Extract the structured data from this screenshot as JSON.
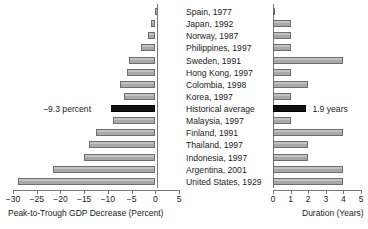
{
  "chart_data": {
    "type": "bar",
    "title": "",
    "subtitle": "",
    "orientation": "horizontal",
    "layout": "paired-diverging-panels",
    "grid": false,
    "legend": null,
    "categories": [
      "Spain, 1977",
      "Japan, 1992",
      "Norway, 1987",
      "Philippines, 1997",
      "Sweden, 1991",
      "Hong Kong, 1997",
      "Colombia, 1998",
      "Korea, 1997",
      "Historical average",
      "Malaysia, 1997",
      "Finland, 1991",
      "Thailand, 1997",
      "Indonesia, 1997",
      "Argentina, 2001",
      "United States, 1929"
    ],
    "panels": [
      {
        "name": "gdp-decrease",
        "xlabel": "Peak-to-Trough GDP Decrease (Percent)",
        "xlim": [
          -30,
          5
        ],
        "xticks": [
          -30,
          -25,
          -20,
          -15,
          -10,
          -5,
          0,
          5
        ],
        "xticklabels": [
          "−30",
          "−25",
          "−20",
          "−15",
          "−10",
          "−5",
          "0",
          "5"
        ],
        "values": [
          0.6,
          -1.0,
          -1.6,
          -3.0,
          -5.5,
          -6.0,
          -7.5,
          -6.7,
          -9.3,
          -9.0,
          -12.5,
          -14.0,
          -15.0,
          -21.5,
          -29.0
        ],
        "annotation": "−9.3 percent",
        "annotation_row": 8
      },
      {
        "name": "duration",
        "xlabel": "Duration (Years)",
        "xlim": [
          0,
          5
        ],
        "xticks": [
          0,
          1,
          2,
          3,
          4,
          5
        ],
        "xticklabels": [
          "0",
          "1",
          "2",
          "3",
          "4",
          "5"
        ],
        "values": [
          0.0,
          1.0,
          1.0,
          1.0,
          4.0,
          1.0,
          2.0,
          1.0,
          1.9,
          1.0,
          4.0,
          2.0,
          2.0,
          4.0,
          4.0
        ],
        "annotation": "1.9 years",
        "annotation_row": 8
      }
    ],
    "highlight_row": 8,
    "highlight_label": "Historical average",
    "colors": {
      "bar_fill": "#b4b4b4",
      "bar_edge": "#6e6e6e",
      "highlight_fill": "#101010",
      "axis": "#777777",
      "text": "#1a1a1a",
      "background": "#ffffff"
    }
  }
}
